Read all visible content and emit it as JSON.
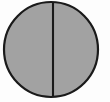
{
  "figure": {
    "title": "Bisected circle",
    "description": "A gray filled circle outlined in black, divided into two equal halves by a vertical diameter line.",
    "canvas": {
      "width": 110,
      "height": 102,
      "background_color": "#fdfdfd"
    },
    "shapes": {
      "circle": {
        "label": "circle",
        "center_x": 51,
        "center_y": 49.5,
        "radius_x": 47,
        "radius_y": 47.5,
        "fill_color": "#a2a2a2",
        "stroke_color": "#1a1a1a",
        "stroke_width": 2.2
      },
      "divider": {
        "label": "vertical diameter line",
        "x": 53,
        "y_start": 2.5,
        "y_end": 96.5,
        "stroke_color": "#1a1a1a",
        "stroke_width": 2.1
      }
    },
    "regions": [
      {
        "label": "left half",
        "fill_color": "#a2a2a2"
      },
      {
        "label": "right half",
        "fill_color": "#a2a2a2"
      }
    ]
  }
}
